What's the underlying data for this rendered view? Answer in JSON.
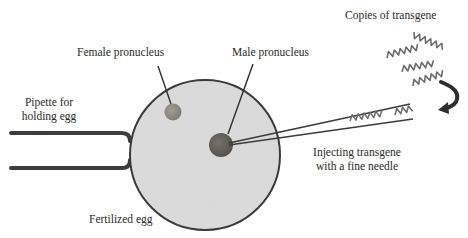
{
  "diagram": {
    "labels": {
      "copies": "Copies of transgene",
      "female": "Female pronucleus",
      "male": "Male pronucleus",
      "pipette_line1": "Pipette for",
      "pipette_line2": "holding egg",
      "injecting_line1": "Injecting transgene",
      "injecting_line2": "with a fine needle",
      "egg": "Fertilized egg"
    },
    "colors": {
      "egg_fill": "#dcdcdc",
      "egg_stroke": "#3a3a3a",
      "female_pronucleus": "#8e8a80",
      "male_pronucleus": "#5f5a55",
      "pipette": "#3c3c3c",
      "needle": "#3a3a3a",
      "transgene": "#6a6a6a",
      "arrow": "#2e2e2e"
    }
  }
}
